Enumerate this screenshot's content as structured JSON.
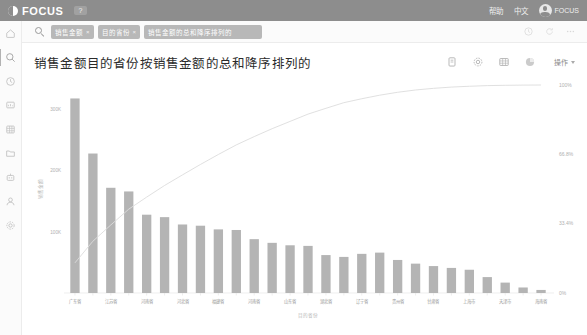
{
  "topbar": {
    "logo_text": "FOCUS",
    "badge": "?",
    "links": [
      "帮助",
      "中文"
    ],
    "user_name": "FOCUS"
  },
  "search": {
    "icon": "search-icon",
    "tokens": [
      {
        "label": "销售金额",
        "close": "×"
      },
      {
        "label": "目的省份",
        "close": "×"
      },
      {
        "label": "销售金额的总和降序排列的",
        "close": "×"
      }
    ],
    "right_icons": [
      "history-icon",
      "refresh-icon",
      "more-icon"
    ]
  },
  "rail": {
    "items": [
      {
        "name": "home-icon",
        "label": "首页",
        "active": false
      },
      {
        "name": "search-icon",
        "label": "搜索",
        "active": true
      },
      {
        "name": "clock-icon",
        "label": "最近",
        "active": false
      },
      {
        "name": "board-icon",
        "label": "看板",
        "active": false
      },
      {
        "name": "table-icon",
        "label": "数据表",
        "active": false
      },
      {
        "name": "folder-icon",
        "label": "文件夹",
        "active": false
      },
      {
        "name": "robot-icon",
        "label": "智能",
        "active": false
      },
      {
        "name": "user-icon",
        "label": "用户",
        "active": false
      },
      {
        "name": "settings-icon",
        "label": "设置",
        "active": false
      }
    ]
  },
  "card": {
    "title": "销售金额目的省份按销售金额的总和降序排列的",
    "tools": [
      {
        "name": "pin-icon",
        "label": "固定"
      },
      {
        "name": "gear-icon",
        "label": "设置"
      },
      {
        "name": "table-icon",
        "label": "表格"
      },
      {
        "name": "pie-icon",
        "label": "图表"
      }
    ],
    "operation_label": "操作"
  },
  "chart_data": {
    "type": "bar",
    "title": "销售金额目的省份按销售金额的总和降序排列的",
    "xlabel": "目的省份",
    "ylabel": "销售金额",
    "y2label": "",
    "ylim": [
      0,
      340000
    ],
    "y2lim": [
      0,
      100
    ],
    "yticks": [
      100000,
      200000,
      300000
    ],
    "ytick_labels": [
      "100K",
      "200K",
      "300K"
    ],
    "y2ticks": [
      0,
      33.4,
      66.8,
      100
    ],
    "y2tick_labels": [
      "0%",
      "33.4%",
      "66.8%",
      "100%"
    ],
    "grid": false,
    "legend": "none",
    "categories": [
      "广东省",
      "浙江省",
      "江苏省",
      "山西省",
      "河南省",
      "江苏省",
      "河北省",
      "湖南省",
      "福建省",
      "四川省",
      "河南省",
      "江西省",
      "山东省",
      "安徽省",
      "湖北省",
      "陕西省",
      "辽宁省",
      "云南省",
      "贵州省",
      "广西省",
      "甘肃省",
      "重庆市",
      "上海市",
      "北京市",
      "天津市",
      "吉林省",
      "海南省"
    ],
    "visible_tick_categories": [
      "广东省",
      "浙江省",
      "山西省",
      "江苏省",
      "河北省",
      "福建省",
      "河南省",
      "山东省",
      "湖北省",
      "辽宁省",
      "贵州省",
      "甘肃省",
      "上海市",
      "天津市",
      "海南省"
    ],
    "values": [
      318000,
      228000,
      172000,
      166000,
      128000,
      124000,
      112000,
      110000,
      104000,
      103000,
      88000,
      82000,
      78000,
      77000,
      62000,
      59000,
      64000,
      66000,
      54000,
      48000,
      44000,
      41000,
      38000,
      26000,
      17000,
      9000,
      5000
    ],
    "cumulative_pct": [
      14.5,
      24.9,
      32.7,
      40.3,
      46.1,
      51.7,
      56.8,
      61.8,
      66.6,
      71.2,
      75.2,
      79.0,
      82.5,
      86.0,
      88.8,
      91.5,
      93.4,
      95.1,
      96.5,
      97.6,
      98.4,
      99.0,
      99.4,
      99.7,
      99.85,
      99.95,
      100.0
    ],
    "bar_color": "#b4b4b4",
    "line_color": "#dcdcdc"
  }
}
